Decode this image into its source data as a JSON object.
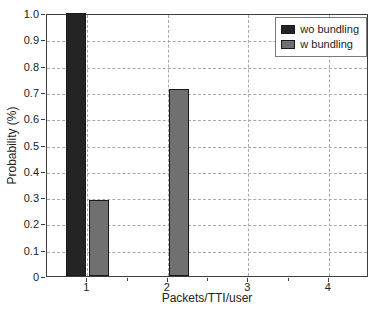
{
  "chart_data": {
    "type": "bar",
    "xlabel": "Packets/TTI/user",
    "ylabel": "Probability (%)",
    "categories": [
      1,
      2,
      3,
      4
    ],
    "series": [
      {
        "name": "wo bundling",
        "color": "#242424",
        "values": [
          1.0,
          0,
          0,
          0
        ]
      },
      {
        "name": "w bundling",
        "color": "#707070",
        "values": [
          0.29,
          0.71,
          0,
          0
        ]
      }
    ],
    "xlim": [
      0.5,
      4.5
    ],
    "ylim": [
      0,
      1
    ],
    "xticks": {
      "labels": [
        "1",
        "2",
        "3",
        "4"
      ],
      "values": [
        1,
        2,
        3,
        4
      ],
      "minor": [
        1.5,
        2.5,
        3.5
      ]
    },
    "yticks": {
      "labels": [
        "1.0",
        "0.9",
        "0.8",
        "0.7",
        "0.6",
        "0.5",
        "0.4",
        "0.3",
        "0.2",
        "0.1",
        "0"
      ],
      "values": [
        1.0,
        0.9,
        0.8,
        0.7,
        0.6,
        0.5,
        0.4,
        0.3,
        0.2,
        0.1,
        0
      ]
    },
    "grid": "dashed",
    "legend": {
      "position": "top-right",
      "items": [
        {
          "label": "wo bundling",
          "color": "#242424"
        },
        {
          "label": "w bundling",
          "color": "#707070"
        }
      ]
    },
    "colors": {
      "grid": "#a9a9a9",
      "axis": "#3d3d3d",
      "text": "#222222",
      "background": "#ffffff",
      "bar_edge": "#1a1a1a"
    }
  }
}
